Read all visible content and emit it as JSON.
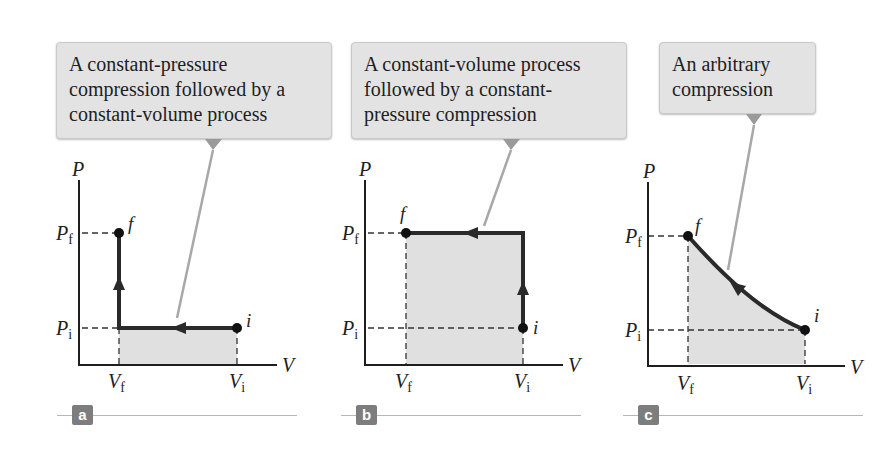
{
  "colors": {
    "background": "#ffffff",
    "callout_fill": "#e3e3e3",
    "callout_border": "#c9c9c9",
    "pointer_line": "#a8a8a8",
    "shaded_area": "#e0e0e0",
    "path_stroke": "#2a2a2a",
    "badge_fill": "#7d7d7d",
    "badge_text": "#ffffff"
  },
  "panels": [
    {
      "id": "a",
      "badge": "a",
      "callout_lines": [
        "A constant-pressure",
        "compression followed by a",
        "constant-volume process"
      ],
      "axis": {
        "y_label": "P",
        "x_label": "V"
      },
      "ticks": {
        "y": [
          {
            "main": "P",
            "sub": "f"
          },
          {
            "main": "P",
            "sub": "i"
          }
        ],
        "x": [
          {
            "main": "V",
            "sub": "f"
          },
          {
            "main": "V",
            "sub": "i"
          }
        ]
      },
      "points": {
        "initial": "i",
        "final": "f"
      },
      "process": "Constant pressure from Vi to Vf, then constant volume from Pi to Pf"
    },
    {
      "id": "b",
      "badge": "b",
      "callout_lines": [
        "A constant-volume process",
        "followed by a constant-",
        "pressure compression"
      ],
      "axis": {
        "y_label": "P",
        "x_label": "V"
      },
      "ticks": {
        "y": [
          {
            "main": "P",
            "sub": "f"
          },
          {
            "main": "P",
            "sub": "i"
          }
        ],
        "x": [
          {
            "main": "V",
            "sub": "f"
          },
          {
            "main": "V",
            "sub": "i"
          }
        ]
      },
      "points": {
        "initial": "i",
        "final": "f"
      },
      "process": "Constant volume from Pi to Pf, then constant pressure from Vi to Vf"
    },
    {
      "id": "c",
      "badge": "c",
      "callout_lines": [
        "An arbitrary",
        "compression"
      ],
      "axis": {
        "y_label": "P",
        "x_label": "V"
      },
      "ticks": {
        "y": [
          {
            "main": "P",
            "sub": "f"
          },
          {
            "main": "P",
            "sub": "i"
          }
        ],
        "x": [
          {
            "main": "V",
            "sub": "f"
          },
          {
            "main": "V",
            "sub": "i"
          }
        ]
      },
      "points": {
        "initial": "i",
        "final": "f"
      },
      "process": "Curved path from (Vi, Pi) to (Vf, Pf)"
    }
  ]
}
